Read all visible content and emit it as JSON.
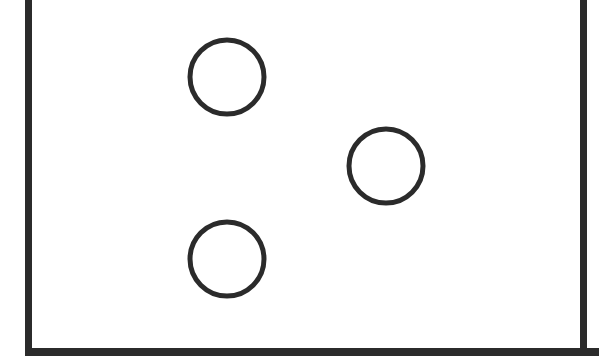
{
  "diagram": {
    "stroke_color": "#2b2b2b",
    "background": "#ffffff",
    "frame": {
      "left_x": 25,
      "right_x": 580,
      "bottom_y": 348,
      "thickness": 7
    },
    "circles": [
      {
        "id": "circle-1",
        "cx": 227,
        "cy": 77,
        "r": 37
      },
      {
        "id": "circle-2",
        "cx": 386,
        "cy": 166,
        "r": 37
      },
      {
        "id": "circle-3",
        "cx": 227,
        "cy": 259,
        "r": 37
      }
    ],
    "circle_stroke_width": 5
  }
}
